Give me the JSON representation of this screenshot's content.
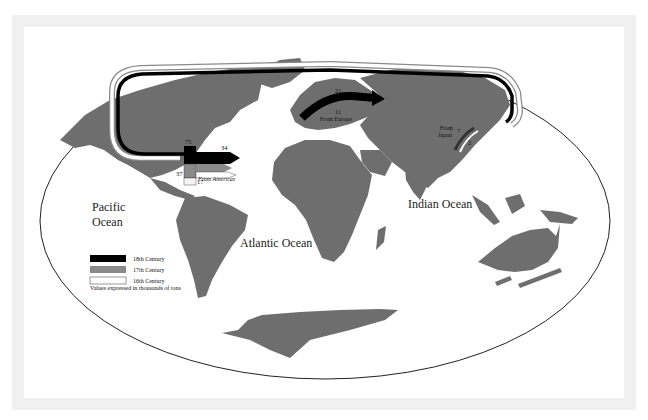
{
  "map": {
    "oceans": [
      {
        "id": "pacific",
        "lines": [
          "Pacific",
          "Ocean"
        ]
      },
      {
        "id": "atlantic",
        "lines": [
          "Atlantic Ocean"
        ]
      },
      {
        "id": "indian",
        "lines": [
          "Indian Ocean"
        ]
      }
    ],
    "flows": {
      "americas": {
        "label": "From Americas",
        "values": {
          "c18_top": "75",
          "c18": "34",
          "c17": "37",
          "c16": "17"
        }
      },
      "europe": {
        "label": "From Europe",
        "values": {
          "c18": "21",
          "c17": "11"
        }
      },
      "japan": {
        "label_line1": "From",
        "label_line2": "Japan",
        "values": {
          "c17": "7",
          "c16": "2"
        }
      }
    },
    "legend": {
      "items": [
        {
          "label": "18th Century",
          "color": "#000000"
        },
        {
          "label": "17th Century",
          "color": "#8a8a8a"
        },
        {
          "label": "16th Century",
          "color": "#ffffff"
        }
      ],
      "note": "Values expressed in thousands of tons"
    },
    "colors": {
      "land": "#6e6e6e",
      "route_18th": "#000000",
      "route_17th": "#8a8a8a",
      "frame": "#f0f0f0"
    }
  }
}
